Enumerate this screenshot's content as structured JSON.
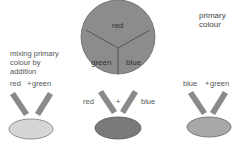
{
  "title": {
    "line1": "primary",
    "line2": "colour"
  },
  "caption": {
    "line1": "mixing primary",
    "line2": "colour by",
    "line3": "addition"
  },
  "wheel": {
    "segments": [
      {
        "label": "red"
      },
      {
        "label": "green"
      },
      {
        "label": "blue"
      }
    ],
    "fill": "#8c8c8c",
    "stroke": "#555555"
  },
  "mixes": [
    {
      "left": "red",
      "operator": "+",
      "right": "green",
      "result_fill": "#d6d6d6"
    },
    {
      "left": "red",
      "operator": "+",
      "right": "blue",
      "result_fill": "#7a7a7a"
    },
    {
      "left": "blue",
      "operator": "+",
      "right": "green",
      "result_fill": "#a8a8a8"
    }
  ],
  "beam_color": "#8a8a8a"
}
